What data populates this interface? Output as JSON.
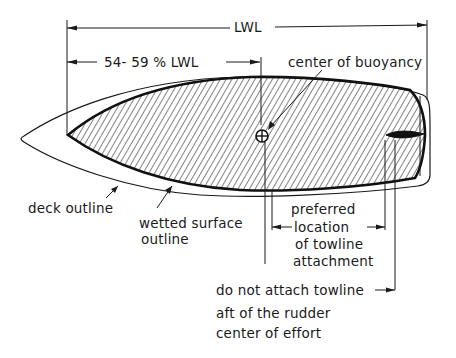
{
  "diagram": {
    "type": "hull-plan-view",
    "dimensions": {
      "lwl": "LWL",
      "cb_range": "54- 59 % LWL"
    },
    "labels": {
      "center_of_buoyancy": "center of buoyancy",
      "deck_outline": "deck outline",
      "wetted_surface_line1": "wetted  surface",
      "wetted_surface_line2": "outline",
      "preferred_line1": "preferred",
      "preferred_line2": "location",
      "preferred_line3": "of towline",
      "preferred_line4": "attachment",
      "donot_line1": "do not attach towline",
      "donot_line2": "aft of the rudder",
      "donot_line3": "center of effort"
    },
    "colors": {
      "ink": "#1a1a1a",
      "background": "#ffffff"
    }
  }
}
